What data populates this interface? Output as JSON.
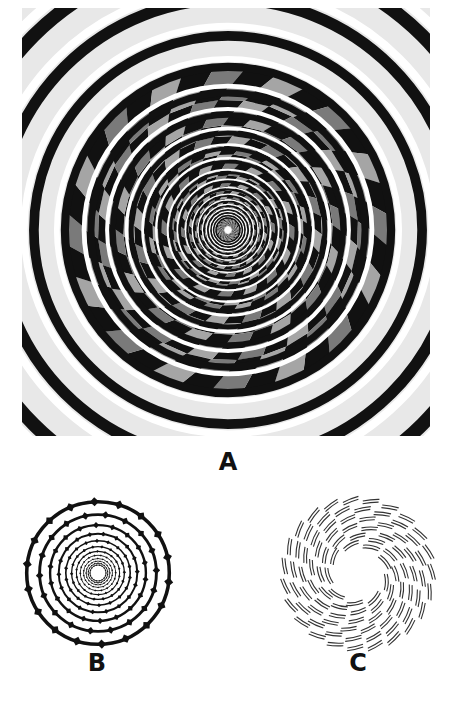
{
  "figure": {
    "panels": [
      {
        "id": "A",
        "label": "A",
        "content": "Fraser spiral illusion on checkered pattern"
      },
      {
        "id": "B",
        "label": "B",
        "content": "Concentric rings with diamond notches appearing as spiral"
      },
      {
        "id": "C",
        "label": "C",
        "content": "Concentric circles composed of tilted arc segments"
      }
    ]
  },
  "colors": {
    "ink": "#111111",
    "mid_gray": "#7a7a7a",
    "light_gray": "#bdbdbd",
    "paper": "#ffffff"
  }
}
